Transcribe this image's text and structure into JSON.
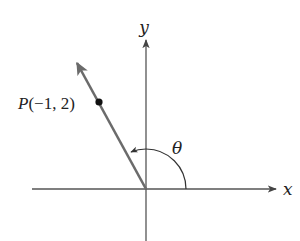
{
  "diagram": {
    "type": "angle-in-standard-position",
    "axes": {
      "x_label": "x",
      "y_label": "y",
      "color": "#555555"
    },
    "point": {
      "name": "P",
      "coords_text": "(−1, 2)",
      "full_label": "P(−1, 2)",
      "x": -1,
      "y": 2
    },
    "angle": {
      "label": "θ",
      "direction": "counterclockwise"
    },
    "ray": {
      "color": "#6b6b6b"
    }
  }
}
